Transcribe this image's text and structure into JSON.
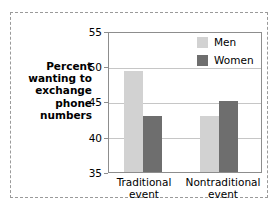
{
  "chart_data": {
    "type": "bar",
    "title": "",
    "xlabel": "",
    "ylabel": "Percent wanting to exchange phone numbers",
    "categories": [
      "Traditional event",
      "Nontraditional event"
    ],
    "series": [
      {
        "name": "Men",
        "values": [
          49.5,
          43.0
        ],
        "color": "#d2d2d2"
      },
      {
        "name": "Women",
        "values": [
          43.0,
          45.2
        ],
        "color": "#6e6e6e"
      }
    ],
    "ylim": [
      35,
      55
    ],
    "yticks": [
      35,
      40,
      45,
      50,
      55
    ],
    "ytick_labels": [
      "35",
      "40",
      "45",
      "50",
      "55"
    ],
    "grid": true,
    "legend_position": "top-right-inside"
  },
  "y_axis_title_lines": [
    "Percent",
    "wanting to",
    "exchange",
    "phone",
    "numbers"
  ],
  "x_axis_groups": [
    {
      "line1": "Traditional",
      "line2": "event"
    },
    {
      "line1": "Nontraditional",
      "line2": "event"
    }
  ],
  "y_tick_labels": {
    "t55": "55",
    "t50": "50",
    "t45": "45",
    "t40": "40",
    "t35": "35"
  },
  "legend": {
    "items": [
      {
        "label": "Men",
        "color": "#d2d2d2"
      },
      {
        "label": "Women",
        "color": "#6e6e6e"
      }
    ]
  },
  "colors": {
    "men": "#d2d2d2",
    "women": "#6e6e6e",
    "grid": "#c6c6c6",
    "axis": "#8d8d8d",
    "frame_dashed": "#9a9a9a",
    "text": "#000000"
  }
}
